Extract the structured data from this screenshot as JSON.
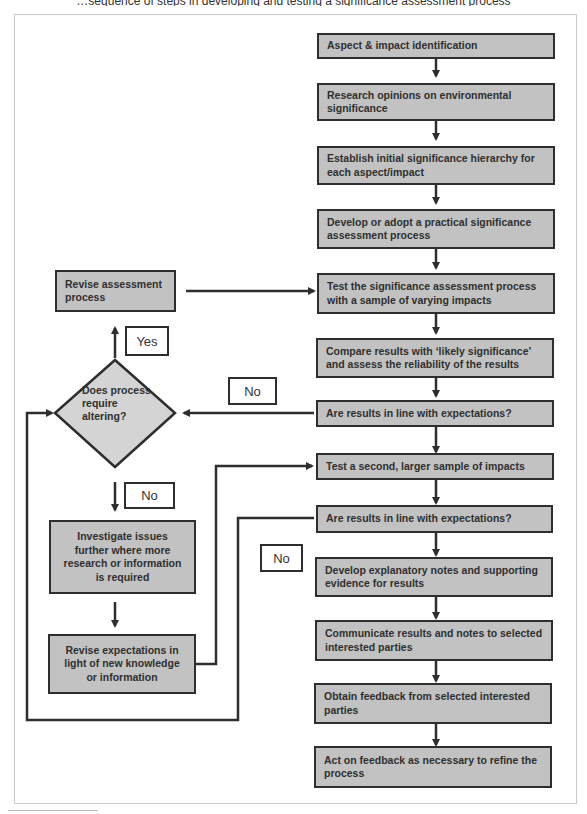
{
  "header": {
    "cut_text": "…sequence of steps in developing and testing a significance assessment process"
  },
  "flow": {
    "main": [
      "Aspect & impact identification",
      "Research opinions on environmental significance",
      "Establish initial significance hierarchy for each aspect/impact",
      "Develop or adopt a practical significance assessment process",
      "Test the significance assessment process with a sample of varying impacts",
      "Compare results with ‘likely significance’ and assess the reliability of the results",
      "Are results in line with expectations?",
      "Test a second, larger sample of impacts",
      "Are results in line with expectations?",
      "Develop explanatory notes and supporting evidence for results",
      "Communicate results and notes to selected interested parties",
      "Obtain feedback from selected interested parties",
      "Act on feedback as necessary to refine the process"
    ],
    "side": {
      "revise_process": "Revise assessment process",
      "decision": "Does process require altering?",
      "investigate": "Investigate issues further where more research or information is required",
      "revise_expectations": "Revise expectations in light of new knowledge or information"
    },
    "labels": {
      "yes": "Yes",
      "no_first_check": "No",
      "no_decision": "No",
      "no_second_check": "No"
    }
  },
  "colors": {
    "box_fill": "#c2c2c2",
    "diamond_fill": "#d4d4d4",
    "stroke": "#2e2e2e",
    "background": "#ffffff"
  }
}
